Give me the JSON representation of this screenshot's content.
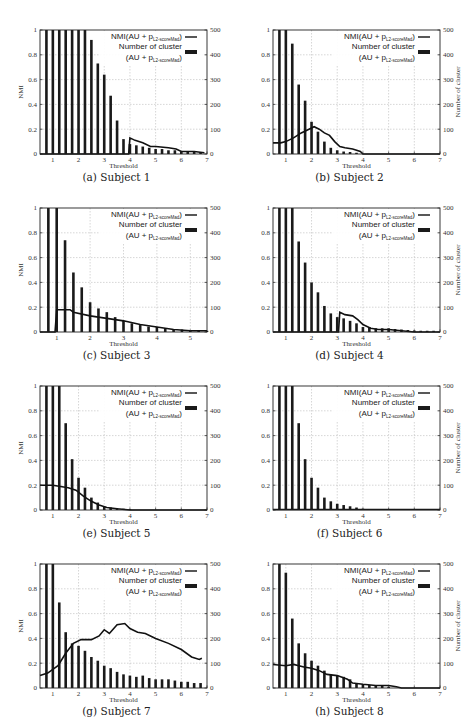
{
  "figure": {
    "legend": {
      "line_label_main": "NMI(AU + p",
      "line_label_sub": "L2-scoreMad",
      "line_label_close": ")",
      "bar_label_line1": "Number of cluster",
      "bar_label_line2_main": "(AU + p",
      "bar_label_line2_sub": "L2-scoreMad",
      "bar_label_line2_close": ")"
    },
    "xlabel": "Threshold",
    "ylabel_left": "NMI",
    "ylabel_right": "Number of cluster",
    "colors": {
      "line": "#111111",
      "bar": "#1a1a1a",
      "grid": "#bbbbbb",
      "axis": "#222222"
    }
  },
  "chart_data": [
    {
      "id": "a",
      "caption": "(a) Subject 1",
      "type": "bar+line",
      "xlim": [
        0.5,
        7
      ],
      "xticks": [
        1,
        2,
        3,
        4,
        5,
        6,
        7
      ],
      "ylim_left": [
        0,
        1
      ],
      "yticks_left": [
        "0",
        "0.2",
        "0.4",
        "0.6",
        "0.8",
        "1"
      ],
      "ylim_right": [
        0,
        500
      ],
      "yticks_right": [
        "0",
        "100",
        "200",
        "300",
        "400",
        "500"
      ],
      "show_left_label": true,
      "show_right_label": false,
      "bars": {
        "x": [
          0.75,
          1.0,
          1.25,
          1.5,
          1.75,
          2.0,
          2.25,
          2.5,
          2.75,
          3.0,
          3.25,
          3.5,
          3.75,
          4.0,
          4.25,
          4.5,
          4.75,
          5.0,
          5.25,
          5.5,
          5.75,
          6.0,
          6.25,
          6.5,
          6.75
        ],
        "values": [
          500,
          500,
          500,
          500,
          500,
          500,
          500,
          460,
          365,
          320,
          235,
          135,
          60,
          40,
          35,
          30,
          25,
          20,
          20,
          15,
          15,
          10,
          8,
          8,
          8
        ]
      },
      "line": {
        "x": [
          0.5,
          3.95,
          4.0,
          4.2,
          4.5,
          4.8,
          5.0,
          5.5,
          5.8,
          6.0,
          6.5,
          6.9
        ],
        "values": [
          0,
          0,
          0.13,
          0.11,
          0.09,
          0.06,
          0.06,
          0.05,
          0.04,
          0.02,
          0.02,
          0.01
        ]
      }
    },
    {
      "id": "b",
      "caption": "(b) Subject 2",
      "type": "bar+line",
      "xlim": [
        0.5,
        7
      ],
      "xticks": [
        1,
        2,
        3,
        4,
        5,
        6,
        7
      ],
      "ylim_left": [
        0,
        1
      ],
      "yticks_left": [
        "0",
        "0.2",
        "0.4",
        "0.6",
        "0.8",
        "1"
      ],
      "ylim_right": [
        0,
        500
      ],
      "yticks_right": [
        "0",
        "100",
        "200",
        "300",
        "400",
        "500"
      ],
      "show_left_label": false,
      "show_right_label": true,
      "bars": {
        "x": [
          0.75,
          1.0,
          1.25,
          1.5,
          1.75,
          2.0,
          2.25,
          2.5,
          2.75,
          3.0,
          3.25,
          3.5,
          3.75
        ],
        "values": [
          500,
          500,
          445,
          280,
          215,
          130,
          90,
          50,
          25,
          15,
          10,
          8,
          5
        ]
      },
      "line": {
        "x": [
          0.5,
          0.8,
          1.0,
          1.3,
          1.6,
          1.9,
          2.1,
          2.3,
          2.5,
          2.7,
          2.9,
          3.1,
          3.3,
          3.6,
          3.9,
          4.0,
          7.0
        ],
        "values": [
          0.09,
          0.09,
          0.1,
          0.13,
          0.17,
          0.2,
          0.22,
          0.2,
          0.17,
          0.15,
          0.1,
          0.06,
          0.05,
          0.04,
          0.02,
          0,
          0
        ]
      }
    },
    {
      "id": "c",
      "caption": "(c) Subject 3",
      "type": "bar+line",
      "xlim": [
        0.5,
        5.5
      ],
      "xticks": [
        1,
        2,
        3,
        4,
        5
      ],
      "ylim_left": [
        0,
        1
      ],
      "yticks_left": [
        "0",
        "0.2",
        "0.4",
        "0.6",
        "0.8",
        "1"
      ],
      "ylim_right": [
        0,
        500
      ],
      "yticks_right": [
        "0",
        "100",
        "200",
        "300",
        "400",
        "500"
      ],
      "show_left_label": true,
      "show_right_label": false,
      "bars": {
        "x": [
          0.75,
          1.0,
          1.25,
          1.5,
          1.75,
          2.0,
          2.25,
          2.5,
          2.75,
          3.0,
          3.25,
          3.5,
          3.75,
          4.0,
          4.25,
          4.5,
          4.75,
          5.0,
          5.25,
          5.5
        ],
        "values": [
          500,
          500,
          370,
          240,
          180,
          120,
          95,
          80,
          60,
          45,
          35,
          28,
          22,
          20,
          15,
          12,
          10,
          8,
          6,
          5
        ]
      },
      "line": {
        "x": [
          0.5,
          0.95,
          1.0,
          1.4,
          1.5,
          2.0,
          2.5,
          3.0,
          3.5,
          4.0,
          4.5,
          5.0,
          5.5
        ],
        "values": [
          0,
          0,
          0.18,
          0.18,
          0.16,
          0.13,
          0.11,
          0.09,
          0.06,
          0.04,
          0.02,
          0.01,
          0.01
        ]
      }
    },
    {
      "id": "d",
      "caption": "(d) Subject 4",
      "type": "bar+line",
      "xlim": [
        0.5,
        7
      ],
      "xticks": [
        1,
        2,
        3,
        4,
        5,
        6,
        7
      ],
      "ylim_left": [
        0,
        1
      ],
      "yticks_left": [
        "0",
        "0.2",
        "0.4",
        "0.6",
        "0.8",
        "1"
      ],
      "ylim_right": [
        0,
        500
      ],
      "yticks_right": [
        "0",
        "100",
        "200",
        "300",
        "400",
        "500"
      ],
      "show_left_label": false,
      "show_right_label": true,
      "bars": {
        "x": [
          0.75,
          1.0,
          1.25,
          1.5,
          1.75,
          2.0,
          2.25,
          2.5,
          2.75,
          3.0,
          3.25,
          3.5,
          3.75,
          4.0,
          4.25,
          4.5,
          4.75,
          5.0,
          5.25,
          5.5,
          5.75,
          6.0,
          6.25,
          6.5,
          6.75
        ],
        "values": [
          500,
          500,
          500,
          365,
          280,
          200,
          160,
          105,
          75,
          60,
          55,
          45,
          35,
          20,
          20,
          15,
          15,
          15,
          12,
          10,
          8,
          6,
          5,
          5,
          5
        ]
      },
      "line": {
        "x": [
          0.5,
          3.05,
          3.1,
          3.3,
          3.6,
          3.8,
          4.0,
          4.3,
          4.6,
          5.0,
          5.5,
          6.0,
          7.0
        ],
        "values": [
          0,
          0,
          0.16,
          0.14,
          0.13,
          0.1,
          0.06,
          0.03,
          0.02,
          0.02,
          0.01,
          0,
          0
        ]
      }
    },
    {
      "id": "e",
      "caption": "(e) Subject 5",
      "type": "bar+line",
      "xlim": [
        0.5,
        7
      ],
      "xticks": [
        1,
        2,
        3,
        4,
        5,
        6,
        7
      ],
      "ylim_left": [
        0,
        1
      ],
      "yticks_left": [
        "0",
        "0.2",
        "0.4",
        "0.6",
        "0.8",
        "1"
      ],
      "ylim_right": [
        0,
        500
      ],
      "yticks_right": [
        "0",
        "100",
        "200",
        "300",
        "400",
        "500"
      ],
      "show_left_label": true,
      "show_right_label": false,
      "bars": {
        "x": [
          0.75,
          1.0,
          1.25,
          1.5,
          1.75,
          2.0,
          2.25,
          2.5,
          2.75,
          3.0,
          3.25,
          3.5,
          3.75,
          4.0
        ],
        "values": [
          500,
          500,
          500,
          350,
          205,
          130,
          90,
          50,
          30,
          15,
          10,
          8,
          5,
          3
        ]
      },
      "line": {
        "x": [
          0.5,
          1.0,
          1.3,
          1.6,
          1.9,
          2.2,
          2.5,
          2.8,
          3.1,
          3.5,
          4.0,
          7.0
        ],
        "values": [
          0.2,
          0.2,
          0.19,
          0.18,
          0.16,
          0.11,
          0.07,
          0.04,
          0.02,
          0.01,
          0,
          0
        ]
      }
    },
    {
      "id": "f",
      "caption": "(f) Subject 6",
      "type": "bar",
      "xlim": [
        0.5,
        7
      ],
      "xticks": [
        1,
        2,
        3,
        4,
        5,
        6,
        7
      ],
      "ylim_left": [
        0,
        1
      ],
      "yticks_left": [
        "0",
        "0.2",
        "0.4",
        "0.6",
        "0.8",
        "1"
      ],
      "ylim_right": [
        0,
        500
      ],
      "yticks_right": [
        "0",
        "100",
        "200",
        "300",
        "400",
        "500"
      ],
      "show_left_label": false,
      "show_right_label": true,
      "bars": {
        "x": [
          0.75,
          1.0,
          1.25,
          1.5,
          1.75,
          2.0,
          2.25,
          2.5,
          2.75,
          3.0,
          3.25,
          3.5,
          3.75,
          4.0
        ],
        "values": [
          500,
          500,
          500,
          350,
          205,
          130,
          90,
          50,
          35,
          25,
          20,
          15,
          10,
          5
        ]
      },
      "line": {
        "x": [
          0.5,
          7.0
        ],
        "values": [
          0,
          0
        ]
      }
    },
    {
      "id": "g",
      "caption": "(g) Subject 7",
      "type": "bar+line",
      "xlim": [
        0.5,
        7
      ],
      "xticks": [
        1,
        2,
        3,
        4,
        5,
        6,
        7
      ],
      "ylim_left": [
        0,
        1
      ],
      "yticks_left": [
        "0",
        "0.2",
        "0.4",
        "0.6",
        "0.8",
        "1"
      ],
      "ylim_right": [
        0,
        500
      ],
      "yticks_right": [
        "0",
        "100",
        "200",
        "300",
        "400",
        "500"
      ],
      "show_left_label": true,
      "show_right_label": false,
      "bars": {
        "x": [
          0.75,
          1.0,
          1.25,
          1.5,
          1.75,
          2.0,
          2.25,
          2.5,
          2.75,
          3.0,
          3.25,
          3.5,
          3.75,
          4.0,
          4.25,
          4.5,
          4.75,
          5.0,
          5.25,
          5.5,
          5.75,
          6.0,
          6.25,
          6.5,
          6.75
        ],
        "values": [
          500,
          500,
          345,
          225,
          180,
          170,
          150,
          125,
          110,
          90,
          80,
          65,
          55,
          50,
          45,
          50,
          40,
          35,
          35,
          35,
          30,
          25,
          25,
          20,
          20
        ]
      },
      "line": {
        "x": [
          0.5,
          0.8,
          1.2,
          1.5,
          1.8,
          2.1,
          2.5,
          2.8,
          3.0,
          3.2,
          3.5,
          3.8,
          4.0,
          4.3,
          4.6,
          5.0,
          5.5,
          6.0,
          6.4,
          6.7,
          6.8
        ],
        "values": [
          0.1,
          0.12,
          0.18,
          0.28,
          0.36,
          0.39,
          0.39,
          0.42,
          0.47,
          0.44,
          0.51,
          0.52,
          0.48,
          0.45,
          0.44,
          0.4,
          0.36,
          0.31,
          0.25,
          0.23,
          0.24
        ]
      }
    },
    {
      "id": "h",
      "caption": "(h) Subject 8",
      "type": "bar+line",
      "xlim": [
        0.5,
        7
      ],
      "xticks": [
        1,
        2,
        3,
        4,
        5,
        6,
        7
      ],
      "ylim_left": [
        0,
        1
      ],
      "yticks_left": [
        "0",
        "0.2",
        "0.4",
        "0.6",
        "0.8",
        "1"
      ],
      "ylim_right": [
        0,
        500
      ],
      "yticks_right": [
        "0",
        "100",
        "200",
        "300",
        "400",
        "500"
      ],
      "show_left_label": false,
      "show_right_label": true,
      "bars": {
        "x": [
          0.75,
          1.0,
          1.25,
          1.5,
          1.75,
          2.0,
          2.25,
          2.5,
          2.75,
          3.0,
          3.25,
          3.5,
          3.75,
          4.0,
          4.25,
          4.5,
          4.75,
          5.0
        ],
        "values": [
          500,
          465,
          280,
          180,
          140,
          110,
          90,
          70,
          55,
          50,
          45,
          35,
          20,
          15,
          12,
          10,
          8,
          5
        ]
      },
      "line": {
        "x": [
          0.5,
          1.0,
          1.3,
          1.7,
          2.0,
          2.3,
          2.6,
          3.0,
          3.4,
          3.6,
          4.0,
          4.5,
          5.0,
          5.3,
          5.5,
          7.0
        ],
        "values": [
          0.19,
          0.18,
          0.19,
          0.17,
          0.16,
          0.14,
          0.11,
          0.1,
          0.07,
          0.04,
          0.03,
          0.02,
          0.02,
          0.01,
          0,
          0
        ]
      }
    }
  ]
}
